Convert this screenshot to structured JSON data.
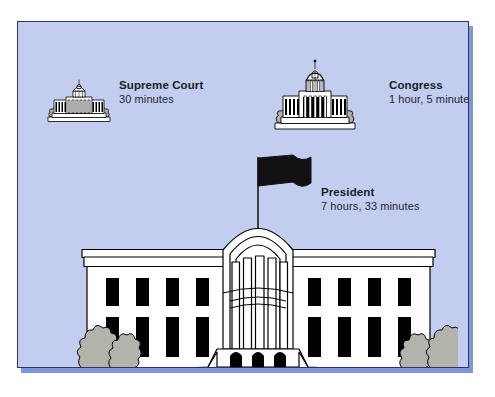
{
  "figure": {
    "kind": "illustrated-diagram",
    "background_color": "#c3cdf0",
    "frame_border_color": "#2c3360",
    "shadow_color": "#7f97d8",
    "building_fill": "#ffffff",
    "ink_color": "#000000",
    "shrub_fill": "#b3b3ab",
    "window_fill": "#000000",
    "flag_fill": "#111111"
  },
  "items": [
    {
      "id": "supreme-court",
      "icon": "supreme-court-building-icon",
      "title": "Supreme Court",
      "value": "30 minutes"
    },
    {
      "id": "congress",
      "icon": "capitol-building-icon",
      "title": "Congress",
      "value": "1 hour, 5 minutes"
    },
    {
      "id": "president",
      "icon": "white-house-building-icon",
      "title": "President",
      "value": "7 hours, 33 minutes"
    }
  ]
}
